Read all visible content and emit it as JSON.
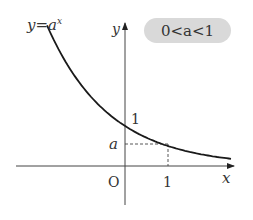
{
  "figure": {
    "function_label_prefix": "y=a",
    "function_label_exponent": "x",
    "condition_badge": "0<a<1",
    "axis_x_label": "x",
    "axis_y_label": "y",
    "origin_label": "O",
    "y_intercept_label": "1",
    "x_tick_label": "1",
    "y_value_label": "a"
  },
  "chart_data": {
    "type": "line",
    "function": "a^x",
    "parameter_a": 0.5,
    "xlabel": "x",
    "ylabel": "y",
    "xlim": [
      -2.6,
      1.8
    ],
    "ylim": [
      -0.8,
      3.4
    ],
    "annotations": [
      {
        "text": "1",
        "at": "y-intercept (0,1)"
      },
      {
        "text": "a",
        "at": "(1,a) dashed guide"
      },
      {
        "text": "O",
        "at": "origin"
      }
    ],
    "grid": false
  }
}
